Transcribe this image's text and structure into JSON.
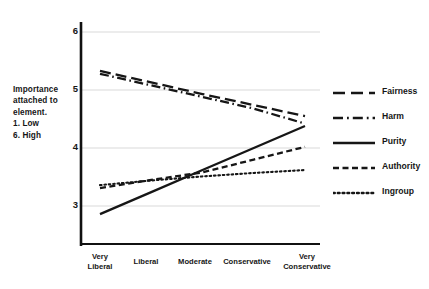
{
  "chart_data": {
    "type": "line",
    "title": "",
    "xlabel": "",
    "ylabel": "Importance attached to element. 1. Low 6. High",
    "ylabel_lines": [
      "Importance",
      "attached to",
      "element.",
      "1. Low",
      "6. High"
    ],
    "categories": [
      "Very Liberal",
      "Liberal",
      "Moderate",
      "Conservative",
      "Very Conservative"
    ],
    "category_lines": [
      [
        "Very",
        "Liberal"
      ],
      [
        "Liberal"
      ],
      [
        "Moderate"
      ],
      [
        "Conservative"
      ],
      [
        "Very",
        "Conservative"
      ]
    ],
    "ylim": [
      2.4,
      6.2
    ],
    "yticks": [
      3,
      4,
      5,
      6
    ],
    "ytick_labels": [
      "3",
      "4",
      "5",
      "6"
    ],
    "grid": true,
    "grid_axis": "y",
    "legend_position": "right",
    "series": [
      {
        "name": "Fairness",
        "style": "long-dash",
        "color": "#161616",
        "values": [
          5.33,
          5.13,
          4.93,
          4.74,
          4.55
        ]
      },
      {
        "name": "Harm",
        "style": "dash-dot",
        "color": "#161616",
        "values": [
          5.28,
          5.08,
          4.88,
          4.68,
          4.42
        ]
      },
      {
        "name": "Purity",
        "style": "solid",
        "color": "#161616",
        "values": [
          2.86,
          3.24,
          3.62,
          4.0,
          4.38
        ]
      },
      {
        "name": "Authority",
        "style": "dash",
        "color": "#161616",
        "values": [
          3.31,
          3.45,
          3.58,
          3.8,
          4.02
        ]
      },
      {
        "name": "Ingroup",
        "style": "dotted",
        "color": "#161616",
        "values": [
          3.36,
          3.44,
          3.51,
          3.57,
          3.62
        ]
      }
    ]
  },
  "axis": {
    "y_axis_color": "#111111",
    "x_axis_color": "#111111",
    "grid_color": "#d9d9d9"
  },
  "legend": {
    "items": [
      {
        "label": "Fairness",
        "style": "long-dash"
      },
      {
        "label": "Harm",
        "style": "dash-dot"
      },
      {
        "label": "Purity",
        "style": "solid"
      },
      {
        "label": "Authority",
        "style": "dash"
      },
      {
        "label": "Ingroup",
        "style": "dotted"
      }
    ]
  }
}
